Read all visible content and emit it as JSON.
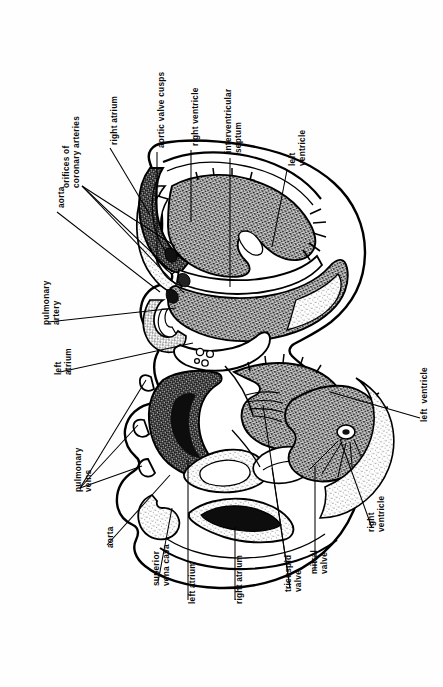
{
  "figure": {
    "orientation": "rotated-90",
    "background_color": "#fefefe",
    "ink_color": "#0a0a0a",
    "width": 443,
    "height": 687
  },
  "labels": [
    {
      "id": "orifices-of-coronary-arteries",
      "line1": "orifices of",
      "line2": "coronary arteries"
    },
    {
      "id": "right-atrium-top",
      "line1": "right atrium",
      "line2": ""
    },
    {
      "id": "aortic-valve-cusps",
      "line1": "aortic valve cusps",
      "line2": ""
    },
    {
      "id": "right-ventricle-top",
      "line1": "right ventricle",
      "line2": ""
    },
    {
      "id": "interventricular-septum",
      "line1": "interventricular",
      "line2": "septum"
    },
    {
      "id": "left-ventricle-top",
      "line1": "left",
      "line2": "ventricle"
    },
    {
      "id": "aorta-top",
      "line1": "aorta",
      "line2": ""
    },
    {
      "id": "pulmonary-artery",
      "line1": "pulmonary",
      "line2": "artery"
    },
    {
      "id": "left-atrium-left",
      "line1": "left",
      "line2": "atrium"
    },
    {
      "id": "pulmonary-veins",
      "line1": "pulmonary",
      "line2": "veins"
    },
    {
      "id": "aorta-bottom",
      "line1": "aorta",
      "line2": ""
    },
    {
      "id": "superior-vena-cava",
      "line1": "superior",
      "line2": "vena cava"
    },
    {
      "id": "left-atrium-bottom",
      "line1": "left atrium",
      "line2": ""
    },
    {
      "id": "right-atrium-bottom",
      "line1": "right atrium",
      "line2": ""
    },
    {
      "id": "tricuspid-valve",
      "line1": "tricuspid",
      "line2": "valve"
    },
    {
      "id": "mitral-valve",
      "line1": "mitral",
      "line2": "valve"
    },
    {
      "id": "right-ventricle-bottom",
      "line1": "right",
      "line2": "ventricle"
    },
    {
      "id": "left-ventricle-right",
      "line1": "left  ventricle",
      "line2": ""
    }
  ]
}
